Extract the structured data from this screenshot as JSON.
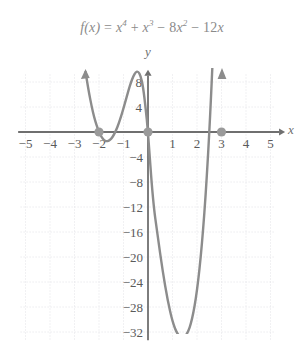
{
  "figure": {
    "title_text": "f(x) = x4 + x3 − 8x2 − 12x",
    "title_parts": {
      "fx": "f(x)",
      "equals": "=",
      "t1_base": "x",
      "t1_exp": "4",
      "plus": "+",
      "t2_base": "x",
      "t2_exp": "3",
      "minus1": "−",
      "t3_coef": "8",
      "t3_base": "x",
      "t3_exp": "2",
      "minus2": "−",
      "t4_coef": "12",
      "t4_base": "x"
    },
    "axis_labels": {
      "x": "x",
      "y": "y"
    },
    "colors": {
      "curve": "#8c8c8c",
      "axis": "#6f6f6f",
      "grid": "#e2e2e6",
      "marker": "#9a9a9a",
      "title_text": "#8a8a8a",
      "tick_text": "#5a5a5a",
      "background": "#ffffff"
    }
  },
  "chart_data": {
    "type": "line",
    "xlabel": "x",
    "ylabel": "y",
    "xlim": [
      -5.4,
      5.4
    ],
    "ylim": [
      -33.5,
      9.5
    ],
    "grid": true,
    "legend": "none",
    "function": "f(x) = x^4 + x^3 - 8x^2 - 12x",
    "xticks": [
      -5,
      -4,
      -3,
      -2,
      -1,
      1,
      2,
      3,
      4,
      5
    ],
    "xtick_labels": [
      "−5",
      "−4",
      "−3",
      "−2",
      "−1",
      "1",
      "2",
      "3",
      "4",
      "5"
    ],
    "yticks": [
      8,
      4,
      -4,
      -8,
      -12,
      -16,
      -20,
      -24,
      -28,
      -32
    ],
    "ytick_labels": [
      "8",
      "4",
      "−4",
      "−8",
      "−12",
      "−16",
      "−20",
      "−24",
      "−28",
      "−32"
    ],
    "x_tick_step": 1,
    "y_tick_step": 4,
    "roots": [
      -2,
      0,
      3
    ],
    "marked_points": [
      {
        "x": -2,
        "y": 0,
        "label": "−2"
      },
      {
        "x": 0,
        "y": 0,
        "label": "0"
      },
      {
        "x": 3,
        "y": 0,
        "label": "3"
      }
    ],
    "local_extrema": [
      {
        "type": "local-min",
        "x": -2,
        "y": 0
      },
      {
        "type": "local-max",
        "x": -1.2,
        "y": 5.0
      },
      {
        "type": "local-min",
        "x": 1.85,
        "y": -32.6
      }
    ],
    "arrows": [
      {
        "at_x": -2.55,
        "direction": "up-left",
        "description": "left branch rising"
      },
      {
        "at_x": 3.05,
        "direction": "up",
        "description": "right branch rising"
      }
    ],
    "x": [
      -2.55,
      -2.5,
      -2.4,
      -2.3,
      -2.2,
      -2.1,
      -2.0,
      -1.9,
      -1.8,
      -1.7,
      -1.6,
      -1.5,
      -1.4,
      -1.3,
      -1.2,
      -1.1,
      -1.0,
      -0.9,
      -0.8,
      -0.7,
      -0.6,
      -0.5,
      -0.4,
      -0.3,
      -0.2,
      -0.1,
      0.0,
      0.2,
      0.4,
      0.6,
      0.8,
      1.0,
      1.2,
      1.4,
      1.6,
      1.8,
      2.0,
      2.2,
      2.4,
      2.6,
      2.8,
      3.0,
      3.05
    ],
    "y": [
      9.6,
      8.4,
      6.1,
      4.1,
      2.4,
      1.1,
      0.0,
      -0.8,
      -1.3,
      -1.5,
      -1.4,
      -1.1,
      -0.5,
      0.3,
      1.3,
      2.5,
      3.8,
      5.2,
      6.6,
      7.9,
      8.9,
      9.6,
      9.7,
      9.0,
      7.2,
      4.0,
      0.0,
      -11.0,
      -16.8,
      -22.3,
      -26.9,
      -30.4,
      -32.4,
      -33.0,
      -32.4,
      -30.1,
      -25.6,
      -18.3,
      -7.6,
      7.4,
      27.5,
      54.0,
      61.4
    ]
  }
}
